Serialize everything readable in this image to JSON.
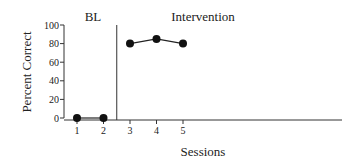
{
  "chart_data": {
    "type": "line",
    "title": "",
    "xlabel": "Sessions",
    "ylabel": "Percent Correct",
    "ylim": [
      0,
      100
    ],
    "yticks": [
      0,
      20,
      40,
      60,
      80,
      100
    ],
    "xticks": [
      1,
      2,
      3,
      4,
      5
    ],
    "grid": false,
    "legend": null,
    "phases": [
      {
        "label": "BL",
        "sessions": [
          1,
          2
        ]
      },
      {
        "label": "Intervention",
        "sessions": [
          3,
          4,
          5
        ]
      }
    ],
    "phase_change_after_session": 2,
    "series": [
      {
        "name": "BL",
        "x": [
          1,
          2
        ],
        "values": [
          0,
          0
        ]
      },
      {
        "name": "Intervention",
        "x": [
          3,
          4,
          5
        ],
        "values": [
          80,
          85,
          80
        ]
      }
    ],
    "colors": {
      "line": "#222222",
      "marker": "#111111",
      "axis": "#333333"
    }
  }
}
